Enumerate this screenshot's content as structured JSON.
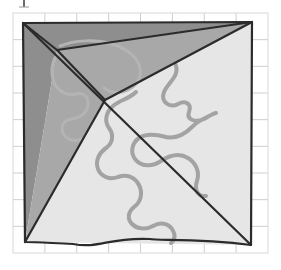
{
  "figure": {
    "kind": "geometric-diagram",
    "background_color": "#ffffff",
    "canvas": {
      "width": 281,
      "height": 270
    }
  },
  "grid": {
    "name": "background-grid",
    "line_color": "#cfcfcf",
    "line_width": 1,
    "x_min": 13,
    "x_max": 268,
    "y_min": 13,
    "y_max": 253,
    "columns": 8,
    "rows": 9,
    "cell_width": 31.9,
    "cell_height": 26.7,
    "border_color": "#d8d8d8"
  },
  "outline": {
    "name": "quadrilateral-outline",
    "stroke_color": "#2b2b2b",
    "stroke_width": 2.2,
    "vertices": [
      {
        "label": "top-left",
        "x": 23,
        "y": 23
      },
      {
        "label": "top-right",
        "x": 252,
        "y": 22
      },
      {
        "label": "bottom-right",
        "x": 251,
        "y": 245
      },
      {
        "label": "bottom-left",
        "x": 25,
        "y": 242
      }
    ],
    "bottom_edge_is_wavy": true
  },
  "interior_points": [
    {
      "name": "upper-left-node",
      "x": 57,
      "y": 50
    },
    {
      "name": "center-node",
      "x": 105,
      "y": 100
    }
  ],
  "regions": [
    {
      "name": "region-top-dark",
      "fill": "#8e8e8e",
      "description": "Dark gray triangle along the top edge",
      "points": "23,23 252,22 57,50"
    },
    {
      "name": "region-left-dark",
      "fill": "#8e8e8e",
      "description": "Dark gray sliver down the left edge",
      "points": "23,23 57,50 25,242"
    },
    {
      "name": "region-left-mid",
      "fill": "#a8a8a8",
      "description": "Medium gray wedge left of center",
      "points": "57,50 105,100 25,242"
    },
    {
      "name": "region-upper-mid",
      "fill": "#a8a8a8",
      "description": "Medium gray wedge between top edge and center",
      "points": "57,50 252,22 105,100"
    },
    {
      "name": "region-lower-light",
      "fill": "#e6e6e6",
      "description": "Light gray region filling the lower and right portion",
      "points": "25,242 105,100 252,22 251,245"
    }
  ],
  "diagonals": [
    {
      "name": "diagonal-main",
      "stroke_color": "#2b2b2b",
      "from": {
        "x": 23,
        "y": 23
      },
      "to": {
        "x": 251,
        "y": 245
      }
    },
    {
      "name": "diagonal-upper-left-spur",
      "stroke_color": "#2b2b2b",
      "from": {
        "x": 23,
        "y": 23
      },
      "to": {
        "x": 57,
        "y": 50
      }
    },
    {
      "name": "diagonal-node-to-center",
      "stroke_color": "#2b2b2b",
      "from": {
        "x": 57,
        "y": 50
      },
      "to": {
        "x": 105,
        "y": 100
      }
    },
    {
      "name": "diagonal-center-to-top-right",
      "stroke_color": "#2b2b2b",
      "from": {
        "x": 105,
        "y": 100
      },
      "to": {
        "x": 252,
        "y": 22
      }
    },
    {
      "name": "diagonal-center-to-bottom-left",
      "stroke_color": "#2b2b2b",
      "from": {
        "x": 105,
        "y": 100
      },
      "to": {
        "x": 25,
        "y": 242
      }
    },
    {
      "name": "diagonal-top-edge-to-node",
      "stroke_color": "#2b2b2b",
      "from": {
        "x": 57,
        "y": 50
      },
      "to": {
        "x": 252,
        "y": 22
      }
    }
  ],
  "curves": [
    {
      "name": "squiggle-curve-main",
      "stroke_color": "#a3a3a3",
      "stroke_width": 4,
      "description": "Thick gray meandering curve sweeping from upper middle down to lower middle",
      "path": "M 175,63 C 181,76 168,82 164,92 C 160,103 171,108 178,104 C 186,100 192,104 189,112 C 186,120 196,123 204,119 C 211,115 214,113 216,113 M 216,113 C 208,116 199,120 192,127 C 184,135 176,139 166,137 C 155,134 146,133 139,138 C 132,143 130,152 135,159 C 141,167 152,167 161,161 C 170,155 180,153 188,158 C 196,163 200,172 197,181 C 194,190 198,197 206,196"
    },
    {
      "name": "squiggle-curve-left",
      "stroke_color": "#a3a3a3",
      "stroke_width": 4,
      "description": "Thick gray meandering curve descending through the left-center to the lower middle",
      "path": "M 136,92 C 129,99 120,100 113,106 C 106,112 104,121 109,128 C 114,135 113,143 106,148 C 99,153 95,161 98,169 C 101,177 110,180 118,177 C 127,174 135,177 139,185 C 143,193 141,202 134,207 C 128,212 127,219 132,224 C 137,229 146,230 153,226 C 160,222 168,223 172,229 C 176,235 175,240 171,243"
    },
    {
      "name": "squiggle-curve-arc-upper-left",
      "stroke_color": "#b4b4b4",
      "stroke_width": 3,
      "description": "Faint gray arc looping around the upper-left interior node",
      "path": "M 60,46 C 75,40 95,39 112,44 C 128,49 138,58 140,68 C 142,78 136,86 128,90 C 120,94 110,93 104,88"
    },
    {
      "name": "squiggle-curve-left-faint",
      "stroke_color": "#b4b4b4",
      "stroke_width": 3,
      "description": "Faint gray curve hooking down the left interior region",
      "path": "M 59,52 C 52,60 50,72 54,82 C 58,92 68,96 76,94 C 84,92 89,97 88,105 C 87,113 80,118 72,119 C 64,120 60,126 63,133 C 66,140 74,142 81,139"
    }
  ]
}
